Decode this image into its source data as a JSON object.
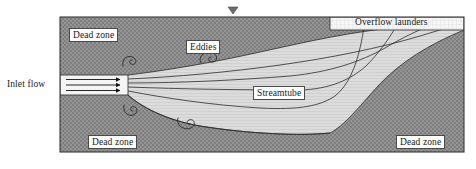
{
  "figure": {
    "type": "sedimentation-tank-flow-schematic",
    "width": 476,
    "height": 169,
    "background_color": "#ffffff"
  },
  "labels": {
    "dead_zone_top": "Dead zone",
    "eddies": "Eddies",
    "overflow_launders": "Overflow launders",
    "inlet_flow": "Inlet flow",
    "streamtube": "Streamtube",
    "dead_zone_bottom_left": "Dead zone",
    "dead_zone_bottom_right": "Dead zone"
  },
  "colors": {
    "dead_zone_fill": "#8e8e8e",
    "streamtube_fill": "#d8d8d8",
    "launder_fill": "#f4f4f4",
    "inlet_fill": "#f2f2f2",
    "outline": "#3a3a3a",
    "streamline": "#2b2b2b",
    "label_text": "#1a1a1a",
    "label_box_bg": "#fdfdfd"
  },
  "elements": {
    "tank": {
      "left": 60,
      "top": 17,
      "right": 464,
      "bottom": 152
    },
    "water_surface_marker": {
      "shape": "down-triangle",
      "x": 233,
      "y": 12
    },
    "inlet": {
      "left": 60,
      "top": 75,
      "right": 128,
      "bottom": 95,
      "arrow_count": 3
    },
    "overflow_launders_band": {
      "left": 330,
      "top": 17,
      "right": 464,
      "bottom": 30
    },
    "eddies": [
      {
        "position": "upper-left",
        "x": 131,
        "y": 60
      },
      {
        "position": "upper-right",
        "x": 209,
        "y": 57
      },
      {
        "position": "lower-left",
        "x": 131,
        "y": 110
      },
      {
        "position": "lower-right",
        "x": 186,
        "y": 122
      }
    ],
    "streamline_count": 5
  }
}
